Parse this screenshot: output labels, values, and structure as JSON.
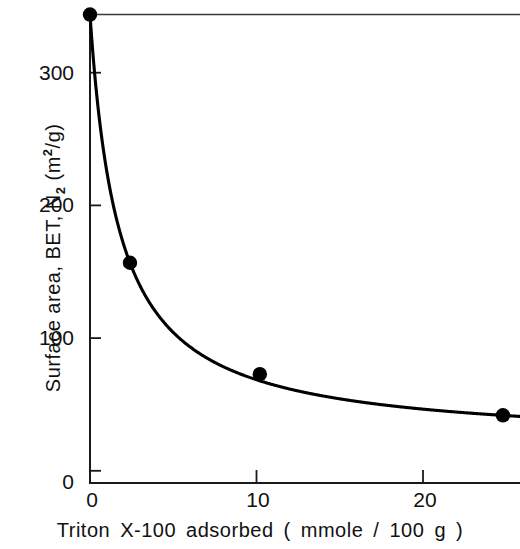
{
  "chart_data": {
    "type": "line",
    "title": "",
    "subtitle": "",
    "xlabel": "Triton  X-100   adsorbed  ( mmole / 100  g )",
    "ylabel": "Surface  area,  BET,  N2  (m2/g)",
    "ylabel_parts": {
      "pre": "Surface  area,  BET,  N",
      "sub": "2",
      "mid": "  (m",
      "sup": "2",
      "post": "/g)"
    },
    "x": [
      0,
      2.4,
      10.2,
      24.8
    ],
    "values": [
      353,
      166,
      82,
      51
    ],
    "series": [
      {
        "name": "BET surface area",
        "x": [
          0,
          2.4,
          10.2,
          24.8
        ],
        "values": [
          353,
          166,
          82,
          51
        ]
      }
    ],
    "xlim": [
      0,
      25.9
    ],
    "ylim": [
      0,
      356
    ],
    "xticks": [
      0,
      10,
      20
    ],
    "xtick_labels": [
      "0",
      "10",
      "20"
    ],
    "yticks": [
      0,
      100,
      200,
      300
    ],
    "ytick_labels": [
      "0",
      "100",
      "200",
      "300"
    ],
    "grid": false,
    "legend": null,
    "marker": "filled-circle",
    "marker_color": "#000000",
    "line_color": "#000000",
    "axis_color": "#111111",
    "background_color": "#ffffff",
    "annotations": []
  },
  "axes": {
    "y_ticks": [
      {
        "label": "300",
        "value": 300
      },
      {
        "label": "200",
        "value": 200
      },
      {
        "label": "100",
        "value": 100
      },
      {
        "label": "0",
        "value": 0
      }
    ],
    "x_ticks": [
      {
        "label": "0",
        "value": 0
      },
      {
        "label": "10",
        "value": 10
      },
      {
        "label": "20",
        "value": 20
      }
    ]
  }
}
